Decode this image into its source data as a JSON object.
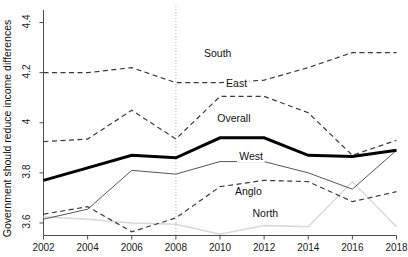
{
  "chart_data": {
    "type": "line",
    "title": "",
    "xlabel": "",
    "ylabel": "Government should reduce income differences",
    "x": [
      2002,
      2004,
      2006,
      2008,
      2010,
      2012,
      2014,
      2016,
      2018
    ],
    "xlim": [
      2002,
      2018
    ],
    "ylim": [
      3.55,
      4.45
    ],
    "xticks": [
      "2002",
      "2004",
      "2006",
      "2008",
      "2010",
      "2012",
      "2014",
      "2016",
      "2018"
    ],
    "yticks": [
      "3.6",
      "3.8",
      "4",
      "4.2",
      "4.4"
    ],
    "ytick_values": [
      3.6,
      3.8,
      4.0,
      4.2,
      4.4
    ],
    "grid": false,
    "legend": "inline-labels",
    "annotations": [
      {
        "text": "South",
        "x": 2010,
        "y": 4.27
      },
      {
        "text": "East",
        "x": 2011,
        "y": 4.15
      },
      {
        "text": "Overall",
        "x": 2010.6,
        "y": 4.01
      },
      {
        "text": "West",
        "x": 2011.6,
        "y": 3.86
      },
      {
        "text": "Anglo",
        "x": 2011.4,
        "y": 3.72
      },
      {
        "text": "North",
        "x": 2012.2,
        "y": 3.63
      }
    ],
    "reference_line": {
      "x": 2008,
      "style": "dotted",
      "color": "#b3b3b3"
    },
    "series": [
      {
        "name": "South",
        "style": "dashed",
        "color": "#3a3a3a",
        "width": 1.2,
        "values": [
          4.2,
          4.2,
          4.22,
          4.16,
          4.16,
          4.17,
          4.22,
          4.28,
          4.28
        ]
      },
      {
        "name": "East",
        "style": "dashed",
        "color": "#3a3a3a",
        "width": 1.2,
        "values": [
          4.2,
          4.21,
          4.22,
          4.16,
          4.16,
          4.165,
          4.22,
          4.28,
          4.28
        ]
      },
      {
        "name": "Overall",
        "style": "solid",
        "color": "#000000",
        "width": 3.0,
        "values": [
          3.77,
          3.82,
          3.87,
          3.86,
          3.94,
          3.94,
          3.87,
          3.865,
          3.89
        ]
      },
      {
        "name": "West",
        "style": "solid",
        "color": "#555555",
        "width": 1.0,
        "values": [
          3.615,
          3.655,
          3.81,
          3.795,
          3.845,
          3.845,
          3.8,
          3.735,
          3.89
        ]
      },
      {
        "name": "Anglo",
        "style": "dashed",
        "color": "#3a3a3a",
        "width": 1.2,
        "values": [
          3.635,
          3.665,
          3.565,
          3.62,
          3.745,
          3.77,
          3.765,
          3.685,
          3.725
        ]
      },
      {
        "name": "North",
        "style": "solid",
        "color": "#d8d8d8",
        "width": 1.4,
        "values": [
          3.625,
          3.615,
          3.6,
          3.595,
          3.555,
          3.59,
          3.585,
          3.765,
          3.585
        ]
      }
    ]
  },
  "secondary": {
    "east_actual": [
      3.925,
      3.935,
      4.05,
      3.935,
      4.105,
      4.105,
      4.04,
      3.87,
      3.93
    ]
  }
}
